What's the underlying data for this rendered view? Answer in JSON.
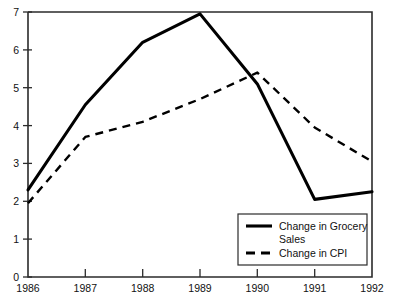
{
  "chart_data": {
    "type": "line",
    "title": "",
    "xlabel": "",
    "ylabel": "",
    "categories": [
      "1986",
      "1987",
      "1988",
      "1989",
      "1990",
      "1991",
      "1992"
    ],
    "x": [
      1986,
      1987,
      1988,
      1989,
      1990,
      1991,
      1992
    ],
    "xlim": [
      1986,
      1992
    ],
    "ylim": [
      0,
      7
    ],
    "yticks": [
      0,
      1,
      2,
      3,
      4,
      5,
      6,
      7
    ],
    "ytick_labels": [
      "0",
      "1",
      "2",
      "3",
      "4",
      "5",
      "6",
      "7"
    ],
    "xtick_labels": [
      "1986",
      "1987",
      "1988",
      "1989",
      "1990",
      "1991",
      "1992"
    ],
    "grid": false,
    "legend_position": "bottom-right",
    "series": [
      {
        "name": "Change in Grocery Sales",
        "style": "solid",
        "color": "#000000",
        "values": [
          2.3,
          4.55,
          6.2,
          6.95,
          5.1,
          2.05,
          2.25
        ]
      },
      {
        "name": "Change in CPI",
        "style": "dashed",
        "color": "#000000",
        "values": [
          1.95,
          3.7,
          4.1,
          4.7,
          5.4,
          3.95,
          3.05
        ]
      }
    ]
  },
  "legend": {
    "entries": [
      {
        "line1": "Change in Grocery",
        "line2": "Sales",
        "style": "solid"
      },
      {
        "line1": "Change in CPI",
        "line2": "",
        "style": "dashed"
      }
    ]
  },
  "axis": {
    "y_labels": [
      "7",
      "6",
      "5",
      "4",
      "3",
      "2",
      "1",
      "0"
    ],
    "x_labels": [
      "1986",
      "1987",
      "1988",
      "1989",
      "1990",
      "1991",
      "1992"
    ]
  },
  "colors": {
    "axis": "#2b2b2b",
    "series": "#000000",
    "background": "#ffffff"
  }
}
